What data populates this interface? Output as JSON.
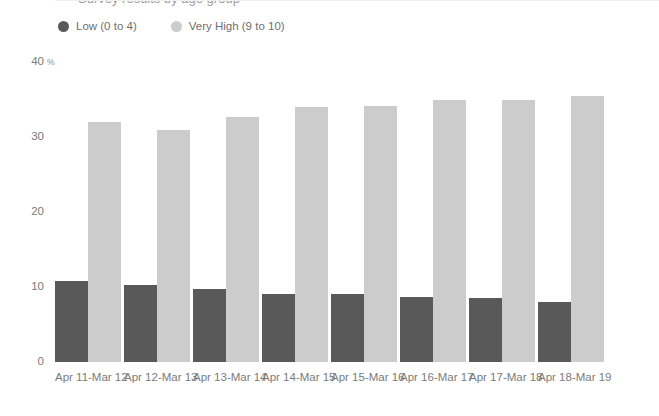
{
  "title": "Survey results by age group",
  "legend": {
    "position": "top-left",
    "entries": [
      {
        "label": "Low (0 to 4)",
        "color": "#595959",
        "marker": "circle-dot"
      },
      {
        "label": "Very High (9 to 10)",
        "color": "#cccccc",
        "marker": "circle-dot"
      }
    ]
  },
  "axis": {
    "y_unit": "%",
    "y_ticks": [
      "0",
      "10",
      "20",
      "30",
      "40"
    ]
  },
  "chart_data": {
    "type": "bar",
    "title": "Survey results by age group",
    "xlabel": "",
    "ylabel": "%",
    "ylim": [
      0,
      40
    ],
    "yticks": [
      0,
      10,
      20,
      30,
      40
    ],
    "grid": false,
    "legend_position": "top-left",
    "categories": [
      "Apr 11-Mar 12",
      "Apr 12-Mar 13",
      "Apr 13-Mar 14",
      "Apr 14-Mar 15",
      "Apr 15-Mar 16",
      "Apr 16-Mar 17",
      "Apr 17-Mar 18",
      "Apr 18-Mar 19"
    ],
    "series": [
      {
        "name": "Low (0 to 4)",
        "color": "#595959",
        "values": [
          10.8,
          10.3,
          9.7,
          9.1,
          9.1,
          8.7,
          8.5,
          8.0
        ]
      },
      {
        "name": "Very High (9 to 10)",
        "color": "#cccccc",
        "values": [
          32.0,
          31.0,
          32.7,
          34.0,
          34.1,
          35.0,
          35.0,
          35.5
        ]
      }
    ]
  }
}
